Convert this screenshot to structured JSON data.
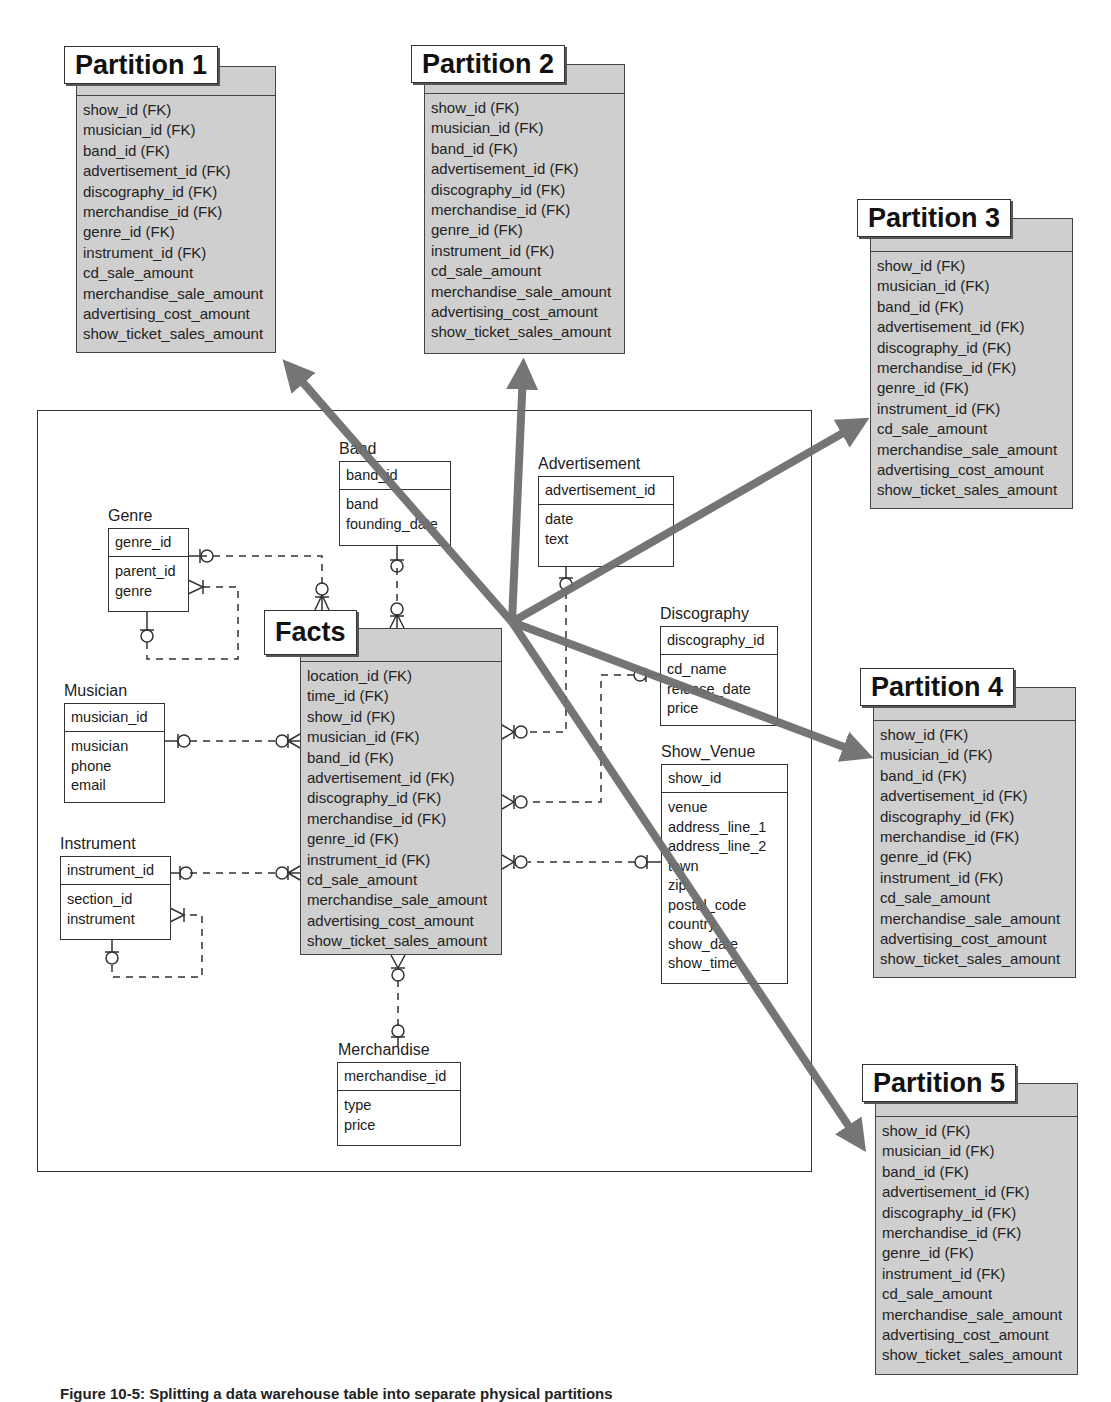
{
  "caption": "Figure 10-5: Splitting a data warehouse table into separate physical partitions",
  "partition_fields": [
    "show_id (FK)",
    "musician_id (FK)",
    "band_id (FK)",
    "advertisement_id (FK)",
    "discography_id (FK)",
    "merchandise_id (FK)",
    "genre_id (FK)",
    "instrument_id (FK)",
    "cd_sale_amount",
    "merchandise_sale_amount",
    "advertising_cost_amount",
    "show_ticket_sales_amount"
  ],
  "partitions": [
    {
      "title": "Partition 1"
    },
    {
      "title": "Partition 2"
    },
    {
      "title": "Partition 3"
    },
    {
      "title": "Partition 4"
    },
    {
      "title": "Partition 5"
    }
  ],
  "facts": {
    "title": "Facts",
    "fields": [
      "location_id (FK)",
      "time_id (FK)",
      "show_id (FK)",
      "musician_id (FK)",
      "band_id (FK)",
      "advertisement_id (FK)",
      "discography_id (FK)",
      "merchandise_id (FK)",
      "genre_id (FK)",
      "instrument_id (FK)",
      "cd_sale_amount",
      "merchandise_sale_amount",
      "advertising_cost_amount",
      "show_ticket_sales_amount"
    ]
  },
  "entities": {
    "band": {
      "name": "Band",
      "key": "band_id",
      "attrs": [
        "band",
        "founding_date"
      ]
    },
    "advertisement": {
      "name": "Advertisement",
      "key": "advertisement_id",
      "attrs": [
        "date",
        "text"
      ]
    },
    "genre": {
      "name": "Genre",
      "key": "genre_id",
      "attrs": [
        "parent_id",
        "genre"
      ]
    },
    "discography": {
      "name": "Discography",
      "key": "discography_id",
      "attrs": [
        "cd_name",
        "release_date",
        "price"
      ]
    },
    "musician": {
      "name": "Musician",
      "key": "musician_id",
      "attrs": [
        "musician",
        "phone",
        "email"
      ]
    },
    "show_venue": {
      "name": "Show_Venue",
      "key": "show_id",
      "attrs": [
        "venue",
        "address_line_1",
        "address_line_2",
        "town",
        "zip",
        "postal_code",
        "country",
        "show_date",
        "show_time"
      ]
    },
    "instrument": {
      "name": "Instrument",
      "key": "instrument_id",
      "attrs": [
        "section_id",
        "instrument"
      ]
    },
    "merchandise": {
      "name": "Merchandise",
      "key": "merchandise_id",
      "attrs": [
        "type",
        "price"
      ]
    }
  },
  "colors": {
    "partition_fill": "#cfcfcf",
    "arrow": "#6e6e6e",
    "line": "#333333"
  }
}
